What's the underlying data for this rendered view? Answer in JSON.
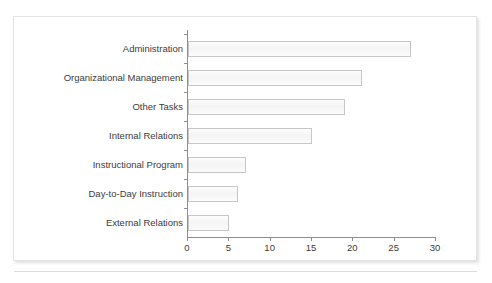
{
  "figure": {
    "top_cut_text": "",
    "caption_cut_text": "",
    "panel_border_color": "#e3e3e3",
    "bar_fill_color": "#f7f7f7",
    "bar_border_color": "#c6c6c6",
    "axis_color": "#8e8e8e",
    "text_color": "#3b3b3b"
  },
  "chart_data": {
    "type": "bar",
    "orientation": "horizontal",
    "title": "",
    "subtitle": "",
    "xlabel": "",
    "ylabel": "",
    "categories": [
      "Administration",
      "Organizational Management",
      "Other Tasks",
      "Internal Relations",
      "Instructional Program",
      "Day-to-Day Instruction",
      "External Relations"
    ],
    "values": [
      27,
      21,
      19,
      15,
      7,
      6,
      5
    ],
    "series": [
      {
        "name": "Percent of time",
        "values": [
          27,
          21,
          19,
          15,
          7,
          6,
          5
        ]
      }
    ],
    "xlim": [
      0,
      30
    ],
    "xticks": [
      0,
      5,
      10,
      15,
      20,
      25,
      30
    ],
    "xtick_labels": [
      "0",
      "5",
      "10",
      "15",
      "20",
      "25",
      "30"
    ],
    "grid": false,
    "legend": false,
    "legend_position": "none",
    "annotations": []
  }
}
